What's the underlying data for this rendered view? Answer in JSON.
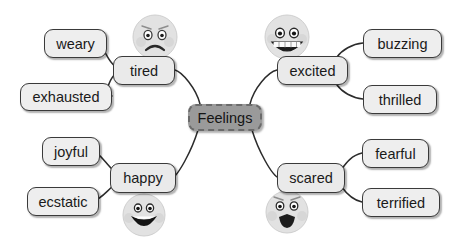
{
  "diagram": {
    "center": {
      "label": "Feelings",
      "fill": "#9a9a9a",
      "border": "#6a6a6a"
    },
    "node_fill": "#eeeeee",
    "node_border": "#3a3a3a",
    "edge_color": "#2b2b2b",
    "background": "#ffffff",
    "branches": [
      {
        "id": "tired",
        "label": "tired",
        "face": "sad-face",
        "leaves": [
          {
            "id": "weary",
            "label": "weary"
          },
          {
            "id": "exhausted",
            "label": "exhausted"
          }
        ]
      },
      {
        "id": "excited",
        "label": "excited",
        "face": "grinning-face",
        "leaves": [
          {
            "id": "buzzing",
            "label": "buzzing"
          },
          {
            "id": "thrilled",
            "label": "thrilled"
          }
        ]
      },
      {
        "id": "happy",
        "label": "happy",
        "face": "smiling-face",
        "leaves": [
          {
            "id": "joyful",
            "label": "joyful"
          },
          {
            "id": "ecstatic",
            "label": "ecstatic"
          }
        ]
      },
      {
        "id": "scared",
        "label": "scared",
        "face": "scared-face",
        "leaves": [
          {
            "id": "fearful",
            "label": "fearful"
          },
          {
            "id": "terrified",
            "label": "terrified"
          }
        ]
      }
    ]
  }
}
